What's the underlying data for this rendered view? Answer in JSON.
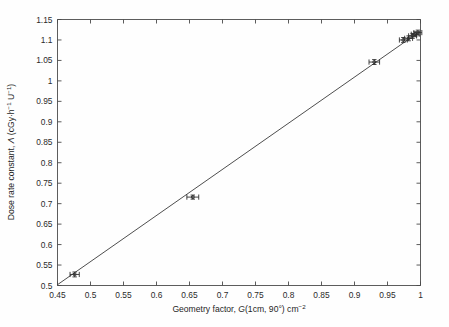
{
  "chart_data": {
    "type": "scatter",
    "title": "",
    "xlabel": "Geometry factor, G(1cm, 90°) cm⁻²",
    "ylabel": "Dose rate constant, Λ (cGy·h⁻¹ U⁻¹)",
    "xlabel_parts": {
      "lead": "Geometry factor, ",
      "symbol": "G",
      "args": "(1cm, 90°) cm",
      "exponent": "−2"
    },
    "ylabel_parts": {
      "lead": "Dose rate constant, ",
      "symbol": "Λ",
      "units_open": " (cGy·h",
      "exp1": "−1",
      "units_mid": " U",
      "exp2": "−1",
      "units_close": ")"
    },
    "xlim": [
      0.45,
      1.0
    ],
    "ylim": [
      0.5,
      1.15
    ],
    "xticks": [
      0.45,
      0.5,
      0.55,
      0.6,
      0.65,
      0.7,
      0.75,
      0.8,
      0.85,
      0.9,
      0.95,
      1.0
    ],
    "xticklabels": [
      "0.45",
      "0.5",
      "0.55",
      "0.6",
      "0.65",
      "0.7",
      "0.75",
      "0.8",
      "0.85",
      "0.9",
      "0.95",
      "1"
    ],
    "yticks": [
      0.5,
      0.55,
      0.6,
      0.65,
      0.7,
      0.75,
      0.8,
      0.85,
      0.9,
      0.95,
      1.0,
      1.05,
      1.1,
      1.15
    ],
    "yticklabels": [
      "0.5",
      "0.55",
      "0.6",
      "0.65",
      "0.7",
      "0.75",
      "0.8",
      "0.85",
      "0.9",
      "0.95",
      "1",
      "1.05",
      "1.1",
      "1.15"
    ],
    "grid": false,
    "legend": "none",
    "points": [
      {
        "x": 0.476,
        "y": 0.527,
        "xerr": 0.007,
        "yerr": 0.006
      },
      {
        "x": 0.655,
        "y": 0.716,
        "xerr": 0.009,
        "yerr": 0.005
      },
      {
        "x": 0.93,
        "y": 1.046,
        "xerr": 0.008,
        "yerr": 0.006
      },
      {
        "x": 0.974,
        "y": 1.1,
        "xerr": 0.006,
        "yerr": 0.006
      },
      {
        "x": 0.982,
        "y": 1.104,
        "xerr": 0.006,
        "yerr": 0.006
      },
      {
        "x": 0.988,
        "y": 1.11,
        "xerr": 0.006,
        "yerr": 0.006
      },
      {
        "x": 0.992,
        "y": 1.114,
        "xerr": 0.006,
        "yerr": 0.006
      },
      {
        "x": 0.996,
        "y": 1.118,
        "xerr": 0.006,
        "yerr": 0.006
      }
    ],
    "fit_line": {
      "x": [
        0.45,
        1.0
      ],
      "y": [
        0.502,
        1.122
      ],
      "description": "linear fit through data"
    }
  }
}
